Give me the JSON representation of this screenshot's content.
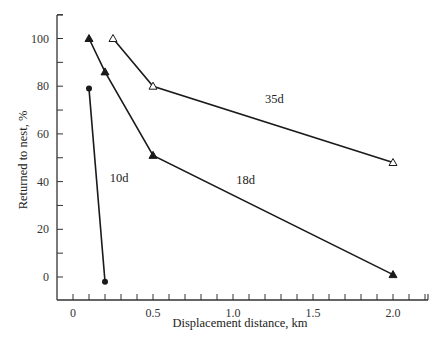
{
  "chart_data": {
    "type": "line",
    "title": "",
    "xlabel": "Displacement distance, km",
    "ylabel": "Returned to nest, %",
    "xlim": [
      -0.1,
      2.2
    ],
    "ylim": [
      -10,
      112
    ],
    "x_ticks": [
      0,
      0.5,
      1.0,
      1.5,
      2.0
    ],
    "x_tick_labels": [
      "0",
      "0.5",
      "1.0",
      "1.5",
      "2.0"
    ],
    "x_minor_tick_step": 0.1,
    "y_ticks": [
      0,
      20,
      40,
      60,
      80,
      100
    ],
    "y_tick_labels": [
      "0",
      "20",
      "40",
      "60",
      "80",
      "100"
    ],
    "y_minor_tick_step": 10,
    "grid": false,
    "legend": "none (series labeled inline)",
    "series": [
      {
        "name": "10d",
        "marker": "filled-circle",
        "x": [
          0.1,
          0.2
        ],
        "y": [
          79,
          -2
        ],
        "label_pos": {
          "x": 0.23,
          "y": 40
        }
      },
      {
        "name": "18d",
        "marker": "filled-triangle",
        "x": [
          0.1,
          0.2,
          0.5,
          2.0
        ],
        "y": [
          100,
          86,
          51,
          1
        ],
        "label_pos": {
          "x": 1.02,
          "y": 39
        }
      },
      {
        "name": "35d",
        "marker": "open-triangle",
        "x": [
          0.25,
          0.5,
          2.0
        ],
        "y": [
          100,
          80,
          48
        ],
        "label_pos": {
          "x": 1.2,
          "y": 73
        }
      }
    ],
    "colors": {
      "line": "#1a1a1a",
      "axis": "#333333",
      "text": "#222222"
    }
  },
  "footer": {
    "fragment": "The flat the ... and ..."
  }
}
